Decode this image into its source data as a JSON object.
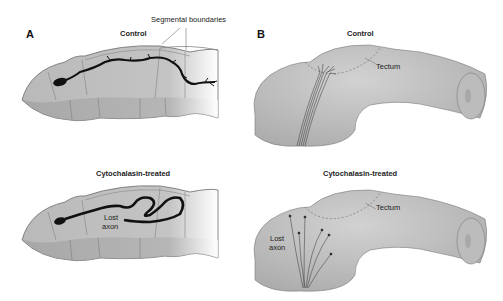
{
  "panels": {
    "a": {
      "letter": "A",
      "control_title": "Control",
      "treated_title": "Cytochalasin-treated",
      "segment_label": "Segmental boundaries",
      "lost_axon_label_1": "Lost",
      "lost_axon_label_2": "axon"
    },
    "b": {
      "letter": "B",
      "control_title": "Control",
      "treated_title": "Cytochalasin-treated",
      "tectum_label_control": "Tectum",
      "tectum_label_treated": "Tectum",
      "lost_axon_label_1": "Lost",
      "lost_axon_label_2": "axon"
    }
  },
  "colors": {
    "tissue": "#b9b9b9",
    "tissue_dark": "#9a9a9a",
    "outline": "#6a6a6a",
    "axon": "#111111"
  }
}
